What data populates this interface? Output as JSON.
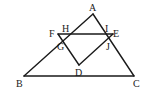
{
  "figure": {
    "type": "geometry",
    "stroke_color": "#1a1a1a",
    "background": "#ffffff",
    "points": {
      "A": {
        "label": "A"
      },
      "B": {
        "label": "B"
      },
      "C": {
        "label": "C"
      },
      "D": {
        "label": "D"
      },
      "E": {
        "label": "E"
      },
      "F": {
        "label": "F"
      },
      "G": {
        "label": "G"
      },
      "H": {
        "label": "H"
      },
      "I": {
        "label": "I"
      },
      "J": {
        "label": "J"
      }
    },
    "segments": [
      [
        "A",
        "B"
      ],
      [
        "B",
        "C"
      ],
      [
        "C",
        "A"
      ],
      [
        "F",
        "E"
      ],
      [
        "F",
        "D"
      ],
      [
        "D",
        "E"
      ]
    ]
  }
}
